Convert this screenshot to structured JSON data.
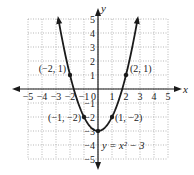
{
  "chart_data": {
    "type": "line",
    "title": "",
    "equation_label": "y = x² − 3",
    "xlabel": "x",
    "ylabel": "y",
    "xlim": [
      -5,
      5
    ],
    "ylim": [
      -5,
      5
    ],
    "grid": true,
    "x_ticks": [
      -5,
      -4,
      -3,
      -2,
      -1,
      1,
      2,
      3,
      4,
      5
    ],
    "y_ticks": [
      -5,
      -4,
      -3,
      -2,
      -1,
      1,
      2,
      3,
      4,
      5
    ],
    "origin_label": "0",
    "series": [
      {
        "name": "y = x^2 - 3",
        "function": "x^2 - 3",
        "x_range": [
          -2.83,
          2.83
        ],
        "color": "#1a1a1a"
      }
    ],
    "points": [
      {
        "x": -2,
        "y": 1,
        "label": "(−2, 1)"
      },
      {
        "x": 2,
        "y": 1,
        "label": "(2, 1)"
      },
      {
        "x": -1,
        "y": -2,
        "label": "(−1, −2)"
      },
      {
        "x": 1,
        "y": -2,
        "label": "(1, −2)"
      },
      {
        "x": 0,
        "y": -3,
        "label": ""
      }
    ]
  },
  "colors": {
    "grid": "#9a9a9a",
    "axis": "#1a1a1a",
    "curve": "#1a1a1a",
    "background": "#ffffff"
  }
}
